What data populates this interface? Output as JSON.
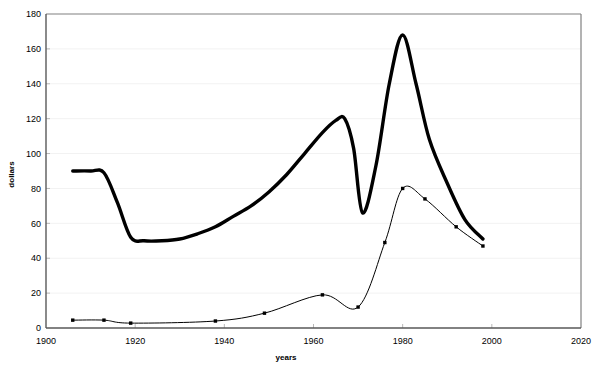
{
  "chart_data": {
    "type": "line",
    "title": "",
    "xlabel": "years",
    "ylabel": "dollars",
    "xlim": [
      1900,
      2020
    ],
    "ylim": [
      0,
      180
    ],
    "xticks": [
      1900,
      1920,
      1940,
      1960,
      1980,
      2000,
      2020
    ],
    "xtick_labels": [
      "1900",
      "1920",
      "1940",
      "1960",
      "1980",
      "2000",
      "2020"
    ],
    "yticks": [
      0,
      20,
      40,
      60,
      80,
      100,
      120,
      140,
      160,
      180
    ],
    "ytick_labels": [
      "0",
      "20",
      "40",
      "60",
      "80",
      "100",
      "120",
      "140",
      "160",
      "180"
    ],
    "grid": true,
    "grid_axis": "y",
    "grid_color": "#f2f2f2",
    "axis_color": "#808080",
    "legend": "none",
    "series": [
      {
        "name": "thick-series",
        "color": "#000000",
        "line_width": 3.4,
        "markers": false,
        "smooth": true,
        "x": [
          1906,
          1910,
          1913,
          1916,
          1919,
          1922,
          1926,
          1930,
          1934,
          1938,
          1942,
          1946,
          1950,
          1954,
          1958,
          1962,
          1965,
          1967,
          1969,
          1971,
          1974,
          1977,
          1980,
          1983,
          1986,
          1990,
          1994,
          1998
        ],
        "y": [
          90,
          90,
          89,
          72,
          52,
          50,
          50,
          51,
          54,
          58,
          64,
          70,
          78,
          88,
          100,
          112,
          119,
          120,
          103,
          66,
          93,
          140,
          168,
          140,
          108,
          83,
          62,
          51
        ]
      },
      {
        "name": "thin-series",
        "color": "#000000",
        "line_width": 1,
        "markers": true,
        "marker_size": 3,
        "smooth": true,
        "x": [
          1906,
          1913,
          1919,
          1938,
          1949,
          1962,
          1970,
          1976,
          1980,
          1985,
          1992,
          1998
        ],
        "y": [
          4.5,
          4.5,
          2.8,
          4.0,
          8.5,
          19,
          12,
          49,
          80,
          74,
          58,
          47
        ]
      }
    ],
    "annotations": []
  }
}
